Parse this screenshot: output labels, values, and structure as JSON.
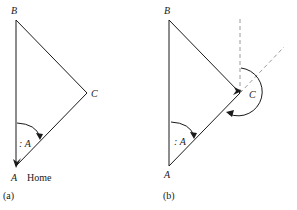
{
  "panels": [
    {
      "id": "a",
      "caption": "(a)",
      "vertices": {
        "A": {
          "label": "A",
          "x": 16,
          "y": 166
        },
        "B": {
          "label": "B",
          "x": 16,
          "y": 20
        },
        "C": {
          "label": "C",
          "x": 87,
          "y": 93
        }
      },
      "home_label": "Home",
      "angle_label": ": A",
      "turn_arrows": [
        "angle-at-A"
      ],
      "guide_lines": []
    },
    {
      "id": "b",
      "caption": "(b)",
      "vertices": {
        "A": {
          "label": "A",
          "x": 169,
          "y": 166
        },
        "B": {
          "label": "B",
          "x": 169,
          "y": 20
        },
        "C": {
          "label": "C",
          "x": 240,
          "y": 93
        }
      },
      "angle_label": ": A",
      "turn_arrows": [
        "angle-at-A",
        "turn-at-C"
      ],
      "guide_lines": [
        "vertical-from-C",
        "extension-of-AC"
      ]
    }
  ],
  "colors": {
    "stroke": "#1a1a1a",
    "dashed_guide": "#9a9a9a",
    "background": "#ffffff"
  }
}
